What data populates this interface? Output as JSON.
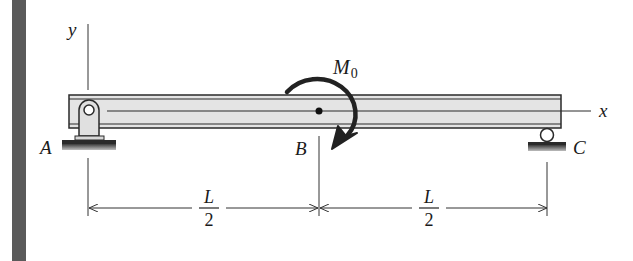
{
  "figure": {
    "labels": {
      "y_axis": "y",
      "x_axis": "x",
      "support_a": "A",
      "point_b": "B",
      "support_c": "C",
      "moment_symbol": "M",
      "moment_subscript": "0"
    },
    "dimensions": [
      {
        "name": "span-ab",
        "numerator": "L",
        "denominator": "2"
      },
      {
        "name": "span-bc",
        "numerator": "L",
        "denominator": "2"
      }
    ],
    "colors": {
      "side_bar": "#5a5a5a",
      "beam_fill": "#e4e4e4",
      "line": "#2a2a2a",
      "moment_arrow": "#222222"
    }
  }
}
